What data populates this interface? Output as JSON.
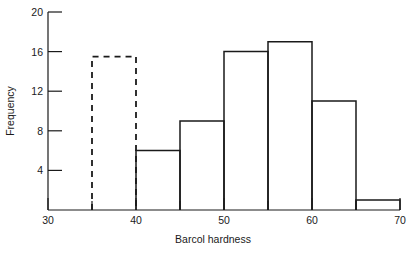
{
  "chart_data": {
    "type": "bar",
    "title": "",
    "xlabel": "Barcol hardness",
    "ylabel": "Frequency",
    "xlim": [
      30,
      72
    ],
    "ylim": [
      0,
      20
    ],
    "grid": false,
    "legend": null,
    "bin_width": 5,
    "bin_edges": [
      35,
      40,
      45,
      50,
      55,
      60,
      65,
      70
    ],
    "categories": [
      "35-40",
      "40-45",
      "45-50",
      "50-55",
      "55-60",
      "60-65",
      "65-70"
    ],
    "values": [
      15.5,
      6,
      9,
      16,
      17,
      11,
      1
    ],
    "bar_styles": [
      "dashed",
      "solid",
      "solid",
      "solid",
      "solid",
      "solid",
      "solid"
    ],
    "bars": [
      {
        "start": 35,
        "end": 40,
        "value": 15.5,
        "style": "dashed"
      },
      {
        "start": 40,
        "end": 45,
        "value": 6,
        "style": "solid"
      },
      {
        "start": 45,
        "end": 50,
        "value": 9,
        "style": "solid"
      },
      {
        "start": 50,
        "end": 55,
        "value": 16,
        "style": "solid"
      },
      {
        "start": 55,
        "end": 60,
        "value": 17,
        "style": "solid"
      },
      {
        "start": 60,
        "end": 65,
        "value": 11,
        "style": "solid"
      },
      {
        "start": 65,
        "end": 70,
        "value": 1,
        "style": "solid"
      }
    ],
    "x_ticks_major": [
      30,
      40,
      50,
      60,
      70
    ],
    "x_tick_labels": [
      "30",
      "40",
      "50",
      "60",
      "70"
    ],
    "x_ticks_minor": [
      35,
      45,
      55,
      65
    ],
    "y_ticks": [
      4,
      8,
      12,
      16,
      20
    ],
    "y_tick_labels": [
      "4",
      "8",
      "12",
      "16",
      "20"
    ],
    "colors": {
      "line": "#1a1a1a",
      "background": "#ffffff"
    }
  },
  "labels": {
    "y_axis_title": "Frequency",
    "x_axis_title": "Barcol hardness",
    "y_tick_20": "20",
    "y_tick_16": "16",
    "y_tick_12": "12",
    "y_tick_8": "8",
    "y_tick_4": "4",
    "x_tick_30": "30",
    "x_tick_40": "40",
    "x_tick_50": "50",
    "x_tick_60": "60",
    "x_tick_70": "70"
  }
}
